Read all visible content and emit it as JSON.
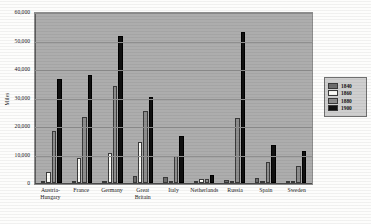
{
  "chart_data": {
    "type": "bar",
    "title": "",
    "xlabel": "",
    "ylabel": "Miles",
    "ylim": [
      0,
      60000
    ],
    "ytick_labels": [
      "0",
      "10,000",
      "20,000",
      "30,000",
      "40,000",
      "50,000",
      "60,000"
    ],
    "ytick_values": [
      0,
      10000,
      20000,
      30000,
      40000,
      50000,
      60000
    ],
    "grid": true,
    "legend_position": "right",
    "categories": [
      "Austria-Hungary",
      "France",
      "Germany",
      "Great Britain",
      "Italy",
      "Netherlands",
      "Russia",
      "Spain",
      "Sweden"
    ],
    "series": [
      {
        "name": "1840",
        "color": "#6d6d6d",
        "values": [
          150,
          300,
          350,
          2400,
          2100,
          200,
          1000,
          1600,
          300
        ]
      },
      {
        "name": "1860",
        "color": "#fbfbf7",
        "values": [
          4000,
          8800,
          10700,
          14500,
          100,
          1400,
          100,
          100,
          100
        ]
      },
      {
        "name": "1880",
        "color": "#8d8d8d",
        "values": [
          18400,
          23000,
          33900,
          25100,
          9400,
          1500,
          22900,
          7500,
          5900
        ]
      },
      {
        "name": "1900",
        "color": "#101010",
        "values": [
          36400,
          38000,
          51500,
          30200,
          16400,
          2700,
          53000,
          13400,
          11400
        ]
      }
    ]
  }
}
